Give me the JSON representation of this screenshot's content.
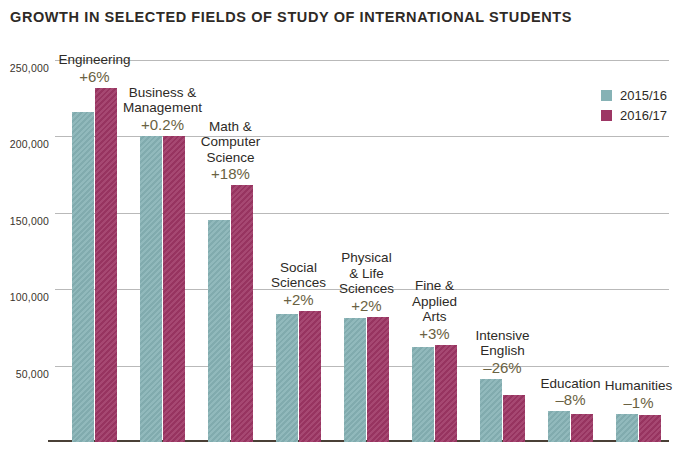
{
  "chart_data": {
    "type": "bar",
    "title": "GROWTH IN SELECTED FIELDS OF STUDY OF INTERNATIONAL STUDENTS",
    "xlabel": "",
    "ylabel": "",
    "ylim": [
      0,
      250000
    ],
    "grid": true,
    "legend_position": "top-right",
    "ytick_labels": [
      "250,000",
      "200,000",
      "150,000",
      "100,000",
      "50,000"
    ],
    "ytick_values": [
      250000,
      200000,
      150000,
      100000,
      50000
    ],
    "categories": [
      "Engineering",
      "Business & Management",
      "Math & Computer Science",
      "Social Sciences",
      "Physical & Life Sciences",
      "Fine & Applied Arts",
      "Intensive English",
      "Education",
      "Humanities"
    ],
    "category_lines": [
      [
        "Engineering"
      ],
      [
        "Business &",
        "Management"
      ],
      [
        "Math &",
        "Computer",
        "Science"
      ],
      [
        "Social",
        "Sciences"
      ],
      [
        "Physical",
        "& Life",
        "Sciences"
      ],
      [
        "Fine &",
        "Applied",
        "Arts"
      ],
      [
        "Intensive",
        "English"
      ],
      [
        "Education"
      ],
      [
        "Humanities"
      ]
    ],
    "growth_labels": [
      "+6%",
      "+0.2%",
      "+18%",
      "+2%",
      "+2%",
      "+3%",
      "–26%",
      "–8%",
      "–1%"
    ],
    "series": [
      {
        "name": "2015/16",
        "color": "#86b2b5",
        "values": [
          216000,
          200000,
          145000,
          84000,
          81000,
          62000,
          41500,
          20000,
          18500
        ]
      },
      {
        "name": "2016/17",
        "color": "#9d3664",
        "values": [
          232000,
          200500,
          168000,
          86000,
          82000,
          63500,
          30500,
          18500,
          18000
        ]
      }
    ]
  },
  "legend": {
    "items": [
      {
        "label": "2015/16",
        "color": "#86b2b5"
      },
      {
        "label": "2016/17",
        "color": "#9d3664"
      }
    ]
  }
}
